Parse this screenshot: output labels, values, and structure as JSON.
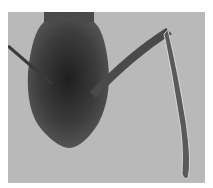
{
  "image": {
    "subject": "ant head specimen, frontal view",
    "background_color": "#b9b9b9",
    "subject_color": "#3a3a3a",
    "border_color": "#ffffff"
  }
}
